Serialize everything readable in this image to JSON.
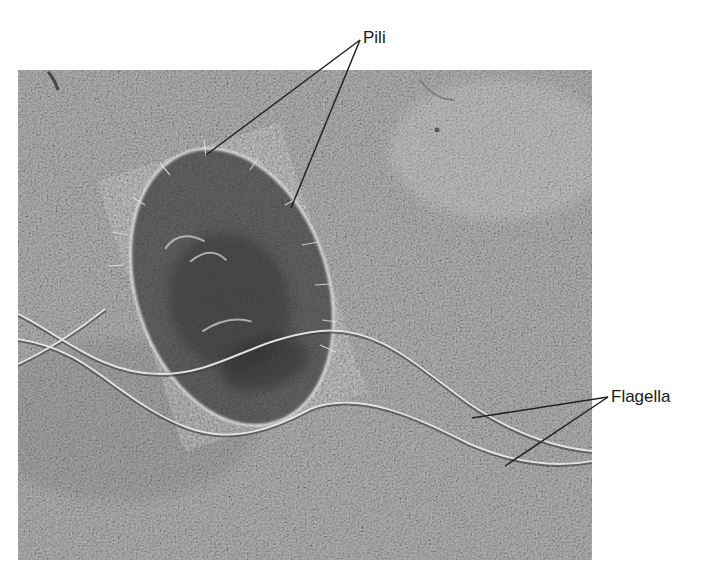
{
  "figure": {
    "type": "electron-micrograph",
    "background_color": "#a9a9a9",
    "cell_fill_color": "#5e5e5e",
    "structure_highlight_color": "#e8e8e8",
    "leader_line_color": "#222222"
  },
  "labels": {
    "pili": {
      "text": "Pili",
      "anchor": [
        360,
        40
      ],
      "targets": [
        [
          206,
          155
        ],
        [
          291,
          208
        ]
      ]
    },
    "flagella": {
      "text": "Flagella",
      "anchor": [
        608,
        397
      ],
      "targets": [
        [
          472,
          418
        ],
        [
          505,
          466
        ]
      ]
    }
  }
}
